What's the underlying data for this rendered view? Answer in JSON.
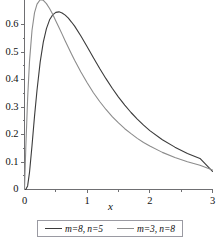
{
  "chart_data": {
    "type": "line",
    "title": "",
    "subtitle": "",
    "xlabel": "x",
    "ylabel": "",
    "xlim": [
      0,
      3
    ],
    "ylim": [
      0,
      0.7
    ],
    "grid": false,
    "legend_position": "bottom",
    "x_ticks": [
      "0",
      "1",
      "2",
      "3"
    ],
    "x_tick_values": [
      0,
      1,
      2,
      3
    ],
    "x_minor_ticks": [
      0.5,
      1.5,
      2.5
    ],
    "y_ticks": [
      "0",
      "0.1",
      "0.2",
      "0.3",
      "0.4",
      "0.5",
      "0.6"
    ],
    "y_tick_values": [
      0,
      0.1,
      0.2,
      0.3,
      0.4,
      0.5,
      0.6
    ],
    "colors": {
      "series_1": "#3b3b3b",
      "series_2": "#8c8c8c",
      "axis": "#6f6f72",
      "legend_border": "#9a9aa2",
      "background": "#ffffff"
    },
    "series": [
      {
        "name": "m=8, n=5",
        "color": "#3b3b3b",
        "x": [
          0,
          0.02,
          0.05,
          0.08,
          0.12,
          0.16,
          0.2,
          0.25,
          0.3,
          0.35,
          0.4,
          0.45,
          0.5,
          0.55,
          0.6,
          0.65,
          0.7,
          0.75,
          0.8,
          0.9,
          1.0,
          1.1,
          1.2,
          1.3,
          1.4,
          1.5,
          1.6,
          1.7,
          1.8,
          1.9,
          2.0,
          2.2,
          2.4,
          2.6,
          2.8,
          3.0
        ],
        "y": [
          0,
          0.0,
          0.013,
          0.062,
          0.16,
          0.267,
          0.362,
          0.463,
          0.536,
          0.585,
          0.617,
          0.635,
          0.644,
          0.646,
          0.642,
          0.634,
          0.623,
          0.609,
          0.594,
          0.558,
          0.519,
          0.479,
          0.44,
          0.403,
          0.368,
          0.336,
          0.307,
          0.28,
          0.256,
          0.234,
          0.214,
          0.181,
          0.154,
          0.131,
          0.113,
          0.066
        ],
        "peak": {
          "x": 0.55,
          "y": 0.646
        }
      },
      {
        "name": "m=3, n=8",
        "color": "#8c8c8c",
        "x": [
          0,
          0.02,
          0.05,
          0.08,
          0.12,
          0.16,
          0.2,
          0.25,
          0.3,
          0.35,
          0.4,
          0.45,
          0.5,
          0.55,
          0.6,
          0.65,
          0.7,
          0.75,
          0.8,
          0.9,
          1.0,
          1.1,
          1.2,
          1.3,
          1.4,
          1.5,
          1.6,
          1.7,
          1.8,
          1.9,
          2.0,
          2.2,
          2.4,
          2.6,
          2.8,
          3.0
        ],
        "y": [
          0,
          0.146,
          0.331,
          0.466,
          0.579,
          0.643,
          0.674,
          0.69,
          0.688,
          0.676,
          0.658,
          0.637,
          0.613,
          0.589,
          0.565,
          0.54,
          0.516,
          0.493,
          0.47,
          0.427,
          0.388,
          0.352,
          0.32,
          0.291,
          0.265,
          0.242,
          0.221,
          0.203,
          0.186,
          0.171,
          0.158,
          0.135,
          0.116,
          0.101,
          0.088,
          0.071
        ],
        "peak": {
          "x": 0.26,
          "y": 0.69
        }
      }
    ],
    "legend": [
      {
        "label": "m=8, n=5",
        "color": "#3b3b3b"
      },
      {
        "label": "m=3, n=8",
        "color": "#8c8c8c"
      }
    ]
  }
}
